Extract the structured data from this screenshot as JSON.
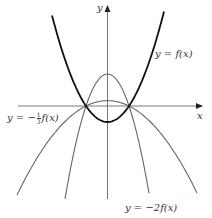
{
  "axes": {
    "x_label": "x",
    "y_label": "y"
  },
  "curves": [
    {
      "id": "f",
      "label": "y = f(x)",
      "color": "#111111",
      "stroke_width": 1.8
    },
    {
      "id": "neg2f",
      "label": "y = −2f(x)",
      "color": "#666666",
      "stroke_width": 1.1
    },
    {
      "id": "negthirdf",
      "label_prefix": "y = −",
      "label_frac_num": "1",
      "label_frac_den": "3",
      "label_suffix": "f(x)",
      "color": "#666666",
      "stroke_width": 1.1
    }
  ],
  "labels": {
    "f": "y = f(x)",
    "neg2f": "y = −2f(x)",
    "negthird_prefix": "y = −",
    "negthird_num": "1",
    "negthird_den": "3",
    "negthird_suffix": "f(x)"
  }
}
